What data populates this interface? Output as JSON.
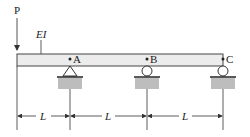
{
  "diagram": {
    "type": "continuous beam with overhang",
    "load_label": "P",
    "stiffness_label": "EI",
    "points": [
      {
        "label": "A",
        "support": "pin"
      },
      {
        "label": "B",
        "support": "roller"
      },
      {
        "label": "C",
        "support": "roller"
      }
    ],
    "dimensions": [
      "L",
      "L",
      "L"
    ],
    "colors": {
      "beam_fill": "#ececec",
      "ground_fill": "#bdbdbd",
      "line": "#333333"
    }
  }
}
